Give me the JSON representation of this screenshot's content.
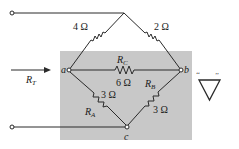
{
  "diagram": {
    "colors": {
      "background": "#ffffff",
      "highlight_box": "#c8c8c8",
      "wire": "#2a2a2a",
      "text": "#1a1a1a"
    },
    "input": {
      "label_main": "R",
      "label_sub": "T",
      "arrow": "right-arrow"
    },
    "nodes": {
      "a": "a",
      "b": "b",
      "c": "c"
    },
    "resistors": [
      {
        "id": "top-left",
        "value": "4 Ω",
        "name": ""
      },
      {
        "id": "top-right",
        "value": "2 Ω",
        "name": ""
      },
      {
        "id": "rc",
        "value": "6 Ω",
        "name_main": "R",
        "name_sub": "C"
      },
      {
        "id": "ra",
        "value": "3 Ω",
        "name_main": "R",
        "name_sub": "A"
      },
      {
        "id": "rb",
        "value": "3 Ω",
        "name_main": "R",
        "name_sub": "B"
      }
    ],
    "symbol": {
      "shape": "delta-triangle",
      "quote_open": "‘‘",
      "quote_close": "’’"
    }
  }
}
